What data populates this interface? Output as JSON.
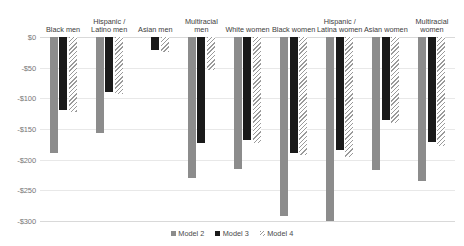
{
  "legend": {
    "position": "bottom-center",
    "entries": [
      {
        "label": "Model 2",
        "key": "m2",
        "color": "#8c8c8c",
        "pattern": "solid"
      },
      {
        "label": "Model 3",
        "key": "m3",
        "color": "#1a1a1a",
        "pattern": "solid"
      },
      {
        "label": "Model 4",
        "key": "m4",
        "color": "#9a9a9a",
        "pattern": "diagonal-hatch"
      }
    ]
  },
  "axis": {
    "y_ticks": [
      "$0",
      "-$50",
      "-$100",
      "-$150",
      "-$200",
      "-$250",
      "-$300"
    ],
    "y_values": [
      0,
      -50,
      -100,
      -150,
      -200,
      -250,
      -300
    ]
  },
  "chart_data": {
    "type": "bar",
    "title": "",
    "subtitle": "",
    "xlabel": "",
    "ylabel": "",
    "ylim": [
      -300,
      0
    ],
    "grid": true,
    "orientation": "vertical",
    "direction": "downward",
    "categories": [
      "Black men",
      "Hispanic /\nLatino men",
      "Asian men",
      "Multiracial\nmen",
      "White women",
      "Black women",
      "Hispanic /\nLatina women",
      "Asian women",
      "Multiracial\nwomen"
    ],
    "category_lines": [
      [
        "Black men"
      ],
      [
        "Hispanic /",
        "Latino men"
      ],
      [
        "Asian men"
      ],
      [
        "Multiracial",
        "men"
      ],
      [
        "White women"
      ],
      [
        "Black women"
      ],
      [
        "Hispanic /",
        "Latina women"
      ],
      [
        "Asian women"
      ],
      [
        "Multiracial",
        "women"
      ]
    ],
    "series": [
      {
        "name": "Model 2",
        "key": "m2",
        "color": "#8c8c8c",
        "values": [
          -189,
          -157,
          null,
          -230,
          -215,
          -292,
          -300,
          -217,
          -235
        ]
      },
      {
        "name": "Model 3",
        "key": "m3",
        "color": "#1a1a1a",
        "values": [
          -119,
          -90,
          -21,
          -173,
          -168,
          -189,
          -185,
          -135,
          -172
        ]
      },
      {
        "name": "Model 4",
        "key": "m4",
        "color": "#9a9a9a",
        "values": [
          -122,
          -93,
          -24,
          -54,
          -173,
          -193,
          -196,
          -140,
          -177
        ]
      }
    ],
    "tick_labels": [
      "$0",
      "-$50",
      "-$100",
      "-$150",
      "-$200",
      "-$250",
      "-$300"
    ],
    "legend_entries": [
      "Model 2",
      "Model 3",
      "Model 4"
    ],
    "annotations": []
  }
}
